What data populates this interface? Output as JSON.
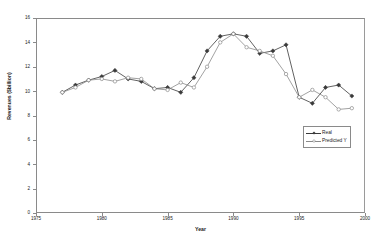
{
  "chart_data": {
    "type": "line",
    "title": "",
    "xlabel": "Year",
    "ylabel": "Revenues ($billion)",
    "xlim": [
      1975,
      2000
    ],
    "ylim": [
      0,
      16
    ],
    "xticks": [
      1975,
      1980,
      1985,
      1990,
      1995,
      2000
    ],
    "yticks": [
      0,
      2,
      4,
      6,
      8,
      10,
      12,
      14,
      16
    ],
    "grid": false,
    "legend_position": "right-center",
    "x": [
      1977,
      1978,
      1979,
      1980,
      1981,
      1982,
      1983,
      1984,
      1985,
      1986,
      1987,
      1988,
      1989,
      1990,
      1991,
      1992,
      1993,
      1994,
      1995,
      1996,
      1997,
      1998,
      1999
    ],
    "series": [
      {
        "name": "Real",
        "marker": "filled-diamond",
        "color": "#3a3a3a",
        "values": [
          9.9,
          10.5,
          10.9,
          11.2,
          11.7,
          11.0,
          10.8,
          10.2,
          10.3,
          9.9,
          11.1,
          13.3,
          14.5,
          14.7,
          14.5,
          13.1,
          13.3,
          13.8,
          9.5,
          9.0,
          10.3,
          10.5,
          9.6
        ]
      },
      {
        "name": "Predicted Y",
        "marker": "open-circle",
        "color": "#8a8a8a",
        "values": [
          9.9,
          10.3,
          10.9,
          11.0,
          10.8,
          11.1,
          11.0,
          10.2,
          10.1,
          10.7,
          10.3,
          12.0,
          14.0,
          14.7,
          13.6,
          13.3,
          12.9,
          11.4,
          9.5,
          10.1,
          9.5,
          8.5,
          8.6
        ]
      }
    ]
  },
  "legend": {
    "entries": [
      {
        "label": "Real"
      },
      {
        "label": "Predicted Y"
      }
    ]
  }
}
